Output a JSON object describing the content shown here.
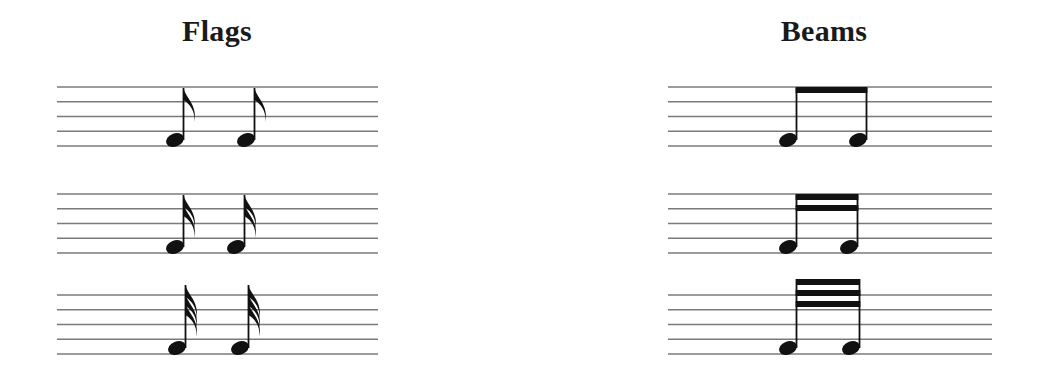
{
  "columns": [
    {
      "id": "flags",
      "title": "Flags",
      "notation": "flags"
    },
    {
      "id": "beams",
      "title": "Beams",
      "notation": "beams"
    }
  ],
  "rows": [
    {
      "note_value": "eighth",
      "count": 1
    },
    {
      "note_value": "sixteenth",
      "count": 2
    },
    {
      "note_value": "thirty-second",
      "count": 3
    }
  ],
  "colors": {
    "ink": "#111111",
    "staff": "#7a7a7a",
    "background": "#ffffff"
  },
  "layout": {
    "staves": [
      {
        "left": [
          57,
          378
        ],
        "right": [
          668,
          992
        ],
        "top": 87
      },
      {
        "left": [
          57,
          378
        ],
        "right": [
          668,
          992
        ],
        "top": 194
      },
      {
        "left": [
          57,
          378
        ],
        "right": [
          668,
          992
        ],
        "top": 295
      }
    ],
    "line_gap": 14.75,
    "flag_notes_x": [
      [
        175,
        246
      ],
      [
        175,
        236
      ],
      [
        177,
        240
      ]
    ],
    "beam_notes_x": [
      [
        788,
        858
      ],
      [
        788,
        849
      ],
      [
        788,
        851
      ]
    ]
  }
}
